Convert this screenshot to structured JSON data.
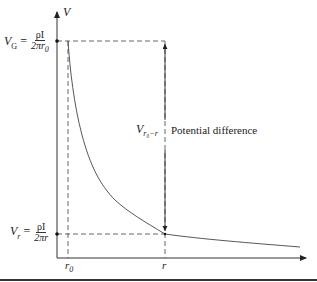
{
  "diagram": {
    "type": "potential-distance-curve",
    "y_axis": {
      "label": "V"
    },
    "x_axis": {
      "ticks": [
        "r0",
        "r"
      ]
    },
    "labels": {
      "v_axis": "V",
      "vg_lhs": "V",
      "vg_sub": "G",
      "vg_eq": "=",
      "vg_num": "ρI",
      "vg_den": "2πr",
      "vg_den_sub": "0",
      "vr_lhs": "V",
      "vr_sub": "r",
      "vr_eq": "=",
      "vr_num": "ρI",
      "vr_den": "2πr",
      "diff_lhs": "V",
      "diff_sub": "r₀−r",
      "diff_text": "Potential difference",
      "tick_r0": "r",
      "tick_r0_sub": "0",
      "tick_r": "r"
    },
    "curve": {
      "description": "Potential V decreasing hyperbolically with distance r",
      "points": [
        [
          68,
          41
        ],
        [
          72,
          80
        ],
        [
          78,
          115
        ],
        [
          86,
          145
        ],
        [
          98,
          175
        ],
        [
          115,
          200
        ],
        [
          135,
          215
        ],
        [
          165,
          234
        ],
        [
          220,
          240
        ],
        [
          300,
          247
        ]
      ]
    },
    "colors": {
      "line": "#333333",
      "dash": "#555555",
      "background": "#ffffff"
    }
  }
}
